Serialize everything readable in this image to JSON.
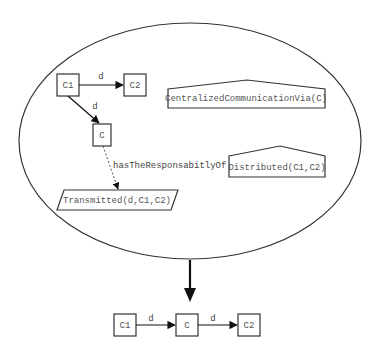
{
  "diagram": {
    "container": {
      "shape": "ellipse",
      "cx": 190,
      "cy": 141,
      "rx": 171,
      "ry": 118
    },
    "top_nodes": {
      "c1": {
        "label": "C1"
      },
      "c2": {
        "label": "C2"
      },
      "c": {
        "label": "C"
      }
    },
    "top_edges": {
      "c1_to_c2": {
        "label": "d",
        "style": "solid"
      },
      "c1_to_c": {
        "label": "d",
        "style": "solid"
      },
      "c_to_transmitted": {
        "label": "hasTheResponsabitlyOf",
        "style": "dashed"
      }
    },
    "predicates": {
      "transmitted": {
        "label": "Transmitted(d,C1,C2)",
        "shape": "parallelogram"
      },
      "centralized": {
        "label": "CentralizedCommunicationVia(C)",
        "shape": "pentagon"
      },
      "distributed": {
        "label": "Distributed(C1,C2)",
        "shape": "pentagon"
      }
    },
    "transform_arrow": {
      "direction": "down"
    },
    "result": {
      "nodes": {
        "c1": {
          "label": "C1"
        },
        "c": {
          "label": "C"
        },
        "c2": {
          "label": "C2"
        }
      },
      "edges": {
        "c1_to_c": {
          "label": "d"
        },
        "c_to_c2": {
          "label": "d"
        }
      }
    }
  }
}
